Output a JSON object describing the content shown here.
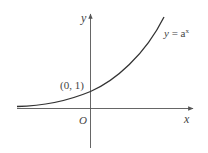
{
  "figure": {
    "axis_labels": {
      "x": "x",
      "y": "y"
    },
    "origin_label": "O",
    "point_label": "(0, 1)",
    "curve_label": {
      "lhs": "y",
      "eq": " = a",
      "sup": "x"
    },
    "colors": {
      "curve": "#333333",
      "axis": "#555555",
      "text": "#444444"
    }
  }
}
